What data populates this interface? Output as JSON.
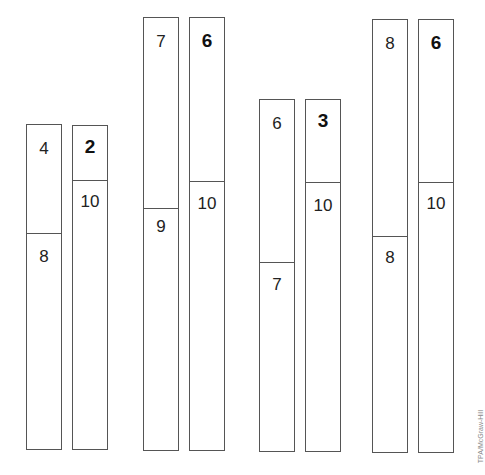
{
  "diagram": {
    "type": "bar-model-pairs",
    "pairs": [
      {
        "left": {
          "top_value": "4",
          "bottom_value": "8"
        },
        "right": {
          "top_value": "2",
          "bottom_value": "10"
        }
      },
      {
        "left": {
          "top_value": "7",
          "bottom_value": "9"
        },
        "right": {
          "top_value": "6",
          "bottom_value": "10"
        }
      },
      {
        "left": {
          "top_value": "6",
          "bottom_value": "7"
        },
        "right": {
          "top_value": "3",
          "bottom_value": "10"
        }
      },
      {
        "left": {
          "top_value": "8",
          "bottom_value": "8"
        },
        "right": {
          "top_value": "6",
          "bottom_value": "10"
        }
      }
    ]
  },
  "credit": "TPA/McGraw-Hill",
  "colors": {
    "line": "#555555",
    "text": "#222222",
    "background": "#ffffff"
  }
}
